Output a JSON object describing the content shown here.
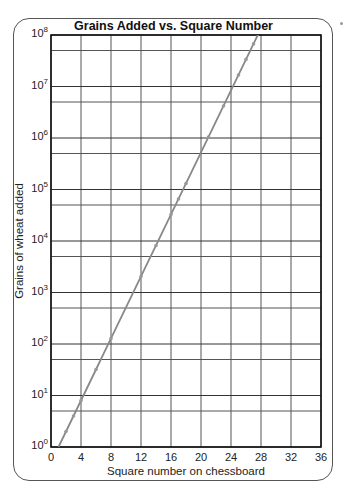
{
  "chart_data": {
    "type": "line",
    "title": "Grains Added vs. Square Number",
    "xlabel": "Square number on chessboard",
    "ylabel": "Grains of wheat added",
    "xlim": [
      0,
      36
    ],
    "ylim": [
      1,
      100000000
    ],
    "yscale": "log",
    "grid": true,
    "legend": null,
    "x_ticks": [
      "0",
      "4",
      "8",
      "12",
      "16",
      "20",
      "24",
      "28",
      "32",
      "36"
    ],
    "y_ticks": [
      {
        "base": "10",
        "exp": "0"
      },
      {
        "base": "10",
        "exp": "1"
      },
      {
        "base": "10",
        "exp": "2"
      },
      {
        "base": "10",
        "exp": "3"
      },
      {
        "base": "10",
        "exp": "4"
      },
      {
        "base": "10",
        "exp": "5"
      },
      {
        "base": "10",
        "exp": "6"
      },
      {
        "base": "10",
        "exp": "7"
      },
      {
        "base": "10",
        "exp": "8"
      }
    ],
    "series": [
      {
        "name": "Grains added",
        "color": "#888888",
        "x": [
          1,
          2,
          3,
          4,
          5,
          6,
          7,
          8,
          9,
          10,
          11,
          12,
          13,
          14,
          15,
          16,
          17,
          18,
          19,
          20,
          21,
          22,
          23,
          24,
          25,
          26,
          27,
          28
        ],
        "values": [
          1,
          2,
          4,
          8,
          16,
          32,
          64,
          128,
          256,
          512,
          1024,
          2048,
          4096,
          8192,
          16384,
          32768,
          65536,
          131072,
          262144,
          524288,
          1048576,
          2097152,
          4194304,
          8388608,
          16777216,
          33554432,
          67108864,
          134217728
        ],
        "marked_x": [
          2,
          3,
          4,
          6,
          8,
          12,
          14,
          16,
          17,
          18,
          21,
          23,
          25,
          26,
          27
        ]
      }
    ]
  }
}
